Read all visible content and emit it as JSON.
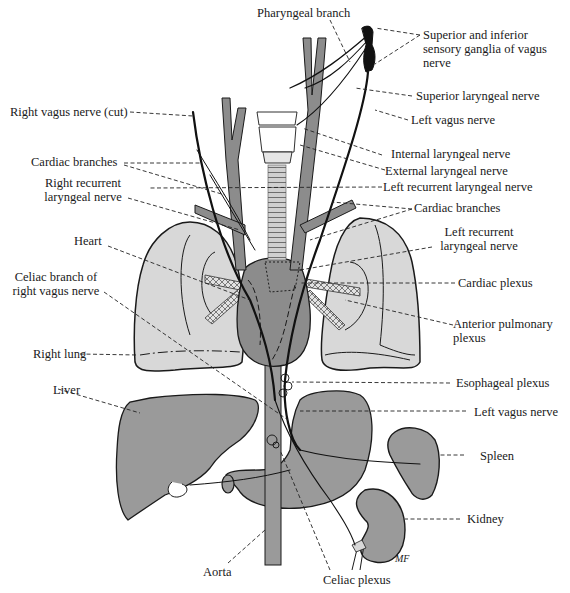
{
  "diagram": {
    "colors": {
      "organ_dark": "#9a9a9a",
      "organ_light": "#d8d8d8",
      "vessel": "#8c8c8c",
      "outline": "#1a1a1a",
      "background": "#ffffff"
    },
    "labels": {
      "pharyngeal_branch": "Pharyngeal branch",
      "ganglia_1": "Superior and inferior",
      "ganglia_2": "sensory ganglia of vagus",
      "ganglia_3": "nerve",
      "superior_laryngeal": "Superior laryngeal nerve",
      "left_vagus_top": "Left vagus nerve",
      "right_vagus_cut": "Right vagus nerve (cut)",
      "internal_laryngeal": "Internal laryngeal nerve",
      "external_laryngeal": "External laryngeal nerve",
      "cardiac_branches_left": "Cardiac branches",
      "right_recurrent_1": "Right recurrent",
      "right_recurrent_2": "laryngeal nerve",
      "left_recurrent_top": "Left recurrent laryngeal nerve",
      "cardiac_branches_right": "Cardiac branches",
      "left_recurrent_1": "Left recurrent",
      "left_recurrent_2": "laryngeal nerve",
      "heart": "Heart",
      "celiac_branch_1": "Celiac branch of",
      "celiac_branch_2": "right vagus nerve",
      "cardiac_plexus": "Cardiac plexus",
      "anterior_pulmonary_1": "Anterior pulmonary",
      "anterior_pulmonary_2": "plexus",
      "right_lung": "Right lung",
      "esophageal_plexus": "Esophageal plexus",
      "liver": "Liver",
      "left_vagus_bottom": "Left vagus nerve",
      "spleen": "Spleen",
      "kidney": "Kidney",
      "aorta": "Aorta",
      "celiac_plexus": "Celiac plexus",
      "signature": "MF"
    }
  }
}
